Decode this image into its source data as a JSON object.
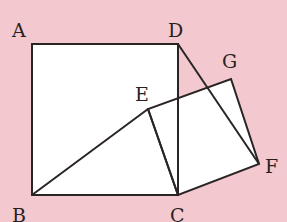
{
  "diagram": {
    "background": "#f3c9cf",
    "fill": "#ffffff",
    "stroke": "#2a2424",
    "points": {
      "A": {
        "label": "A",
        "x": 32,
        "y": 44
      },
      "B": {
        "label": "B",
        "x": 32,
        "y": 195
      },
      "C": {
        "label": "C",
        "x": 178,
        "y": 195
      },
      "D": {
        "label": "D",
        "x": 178,
        "y": 44
      },
      "E": {
        "label": "E",
        "x": 148,
        "y": 109
      },
      "F": {
        "label": "F",
        "x": 259,
        "y": 164
      },
      "G": {
        "label": "G",
        "x": 231,
        "y": 79
      }
    },
    "shapes": [
      "Square ABCD",
      "Square ECFG"
    ],
    "segments": [
      "AB",
      "BC",
      "CD",
      "DA",
      "BE",
      "EC",
      "CF",
      "FG",
      "GE",
      "DF"
    ]
  }
}
